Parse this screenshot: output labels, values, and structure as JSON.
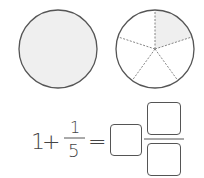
{
  "figure": {
    "whole_circle": {
      "label": "whole",
      "fill": "#efefef",
      "stroke": "#555555"
    },
    "divided_circle": {
      "parts": 5,
      "shaded_parts": 1,
      "shade": "#efefef",
      "stroke": "#555555"
    }
  },
  "equation": {
    "whole_term": "1",
    "plus": "+",
    "fraction_numerator": "1",
    "fraction_denominator": "5",
    "equals": "=",
    "answer_whole_box": "",
    "answer_numerator_box": "",
    "answer_denominator_box": ""
  }
}
